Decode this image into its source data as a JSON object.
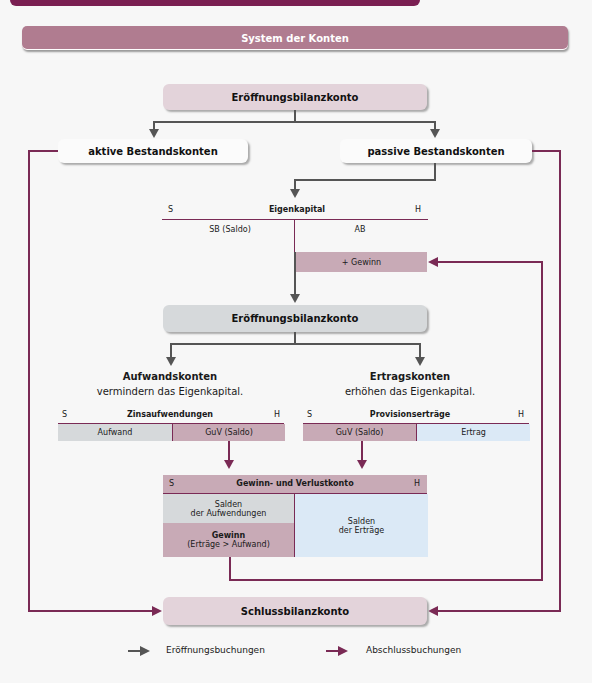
{
  "title": "System der Konten",
  "nodes": {
    "ebk_top": "Eröffnungsbilanzkonto",
    "aktive": "aktive Bestandskonten",
    "passive": "passive Bestandskonten",
    "ebk_mid": "Eröffnungsbilanzkonto",
    "sbk": "Schlussbilanzkonto"
  },
  "eigenkapital": {
    "left_label": "S",
    "title": "Eigenkapital",
    "right_label": "H",
    "left_entry": "SB (Saldo)",
    "right_entry": "AB",
    "gewinn": "+ Gewinn"
  },
  "aufwand": {
    "heading": "Aufwandskonten",
    "sub": "vermindern das Eigenkapital.",
    "account": {
      "s": "S",
      "title": "Zinsaufwendungen",
      "h": "H",
      "left": "Aufwand",
      "right": "GuV (Saldo)"
    }
  },
  "ertrag": {
    "heading": "Ertragskonten",
    "sub": "erhöhen das Eigenkapital.",
    "account": {
      "s": "S",
      "title": "Provisionserträge",
      "h": "H",
      "left": "GuV (Saldo)",
      "right": "Ertrag"
    }
  },
  "guv": {
    "s": "S",
    "title": "Gewinn- und Verlustkonto",
    "h": "H",
    "left_top_1": "Salden",
    "left_top_2": "der Aufwendungen",
    "left_bottom_1": "Gewinn",
    "left_bottom_2": "(Erträge > Aufwand)",
    "right_1": "Salden",
    "right_2": "der Erträge"
  },
  "legend": {
    "opening": "Eröffnungsbuchungen",
    "closing": "Abschlussbuchungen"
  },
  "colors": {
    "closing_arrow": "#7a2a55",
    "opening_arrow": "#555555",
    "title_bar": "#b07c90",
    "pink_cell": "#c8aab6",
    "grey_cell": "#d6d9db",
    "blue_cell": "#dbe9f6"
  }
}
